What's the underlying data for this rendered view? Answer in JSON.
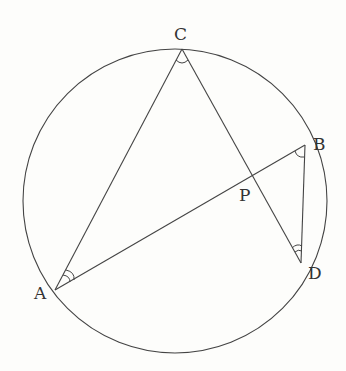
{
  "diagram": {
    "circle": {
      "cx": 175,
      "cy": 201,
      "r": 152
    },
    "points": {
      "A": {
        "x": 55,
        "y": 290,
        "label": "A",
        "lx": 34,
        "ly": 285
      },
      "B": {
        "x": 305,
        "y": 145,
        "label": "B",
        "lx": 313,
        "ly": 136
      },
      "C": {
        "x": 182,
        "y": 49,
        "label": "C",
        "lx": 174,
        "ly": 26
      },
      "D": {
        "x": 301,
        "y": 263,
        "label": "D",
        "lx": 308,
        "ly": 265
      },
      "P": {
        "x": 251,
        "y": 176,
        "label": "P",
        "lx": 239,
        "ly": 187
      }
    },
    "segments": [
      [
        "A",
        "C"
      ],
      [
        "C",
        "D"
      ],
      [
        "A",
        "B"
      ],
      [
        "B",
        "D"
      ]
    ],
    "angle_marks": [
      {
        "at": "C",
        "type": "single"
      },
      {
        "at": "A",
        "type": "double"
      },
      {
        "at": "B",
        "type": "single"
      },
      {
        "at": "D",
        "type": "double"
      }
    ],
    "line_color": "#444444"
  }
}
